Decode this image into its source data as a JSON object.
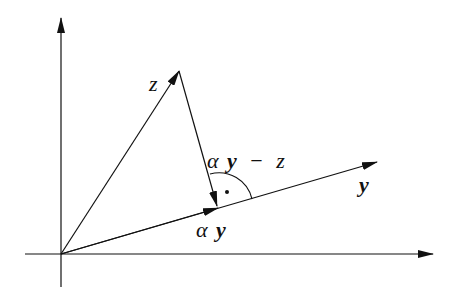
{
  "diagram": {
    "type": "vector-projection",
    "colors": {
      "stroke": "#111111",
      "background": "#ffffff"
    },
    "axes": {
      "origin": [
        61,
        254
      ],
      "x_axis": {
        "from": [
          25,
          254
        ],
        "to": [
          433,
          254
        ]
      },
      "y_axis": {
        "from": [
          61,
          287
        ],
        "to": [
          61,
          18
        ]
      }
    },
    "vectors": [
      {
        "name": "z",
        "from": [
          61,
          254
        ],
        "to": [
          179,
          71
        ]
      },
      {
        "name": "y",
        "from": [
          61,
          254
        ],
        "to": [
          377,
          162
        ]
      },
      {
        "name": "alpha-y",
        "from": [
          61,
          254
        ],
        "to": [
          218,
          208
        ]
      },
      {
        "name": "alpha-y-minus-z",
        "from": [
          179,
          71
        ],
        "to": [
          217,
          206
        ]
      }
    ],
    "right_angle_marker": {
      "center": [
        219,
        208
      ],
      "radius": 35,
      "dot": [
        227,
        192
      ]
    },
    "labels": {
      "z": "z",
      "y": "y",
      "alpha_y_alpha": "α",
      "alpha_y_y": "y",
      "diff_alpha": "α",
      "diff_y": "y",
      "diff_minus": "−",
      "diff_z": "z"
    }
  }
}
